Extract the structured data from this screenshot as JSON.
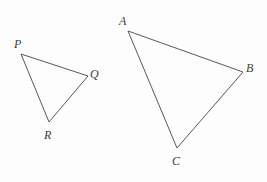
{
  "figure": {
    "background_color": "#fdfdfd",
    "stroke_color": "#58585a",
    "label_color": "#3c3c3c",
    "stroke_width": 1,
    "width": 267,
    "height": 182
  },
  "triangles": [
    {
      "name": "triangle-pqr",
      "vertices": [
        {
          "label": "P",
          "x": 21,
          "y": 54,
          "label_x": 14,
          "label_y": 38
        },
        {
          "label": "Q",
          "x": 88,
          "y": 76,
          "label_x": 90,
          "label_y": 68
        },
        {
          "label": "R",
          "x": 49,
          "y": 122,
          "label_x": 44,
          "label_y": 129
        }
      ]
    },
    {
      "name": "triangle-abc",
      "vertices": [
        {
          "label": "A",
          "x": 128,
          "y": 31,
          "label_x": 119,
          "label_y": 15
        },
        {
          "label": "B",
          "x": 243,
          "y": 72,
          "label_x": 246,
          "label_y": 62
        },
        {
          "label": "C",
          "x": 177,
          "y": 148,
          "label_x": 172,
          "label_y": 155
        }
      ]
    }
  ],
  "labels": {
    "p": "P",
    "q": "Q",
    "r": "R",
    "a": "A",
    "b": "B",
    "c": "C"
  }
}
